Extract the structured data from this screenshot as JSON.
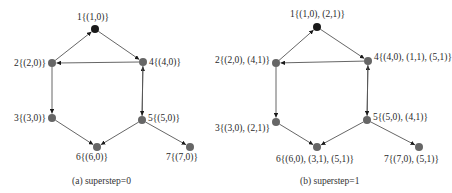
{
  "figure": {
    "panels": [
      {
        "id": "a",
        "caption": "(a)  superstep=0",
        "caption_pos": [
          72,
          184
        ],
        "nodes": [
          {
            "id": "1",
            "label": "1{(1,0)}",
            "x": 95,
            "y": 29,
            "color": "#1a1a1a",
            "lx": 77,
            "ly": 20,
            "anchor": "start"
          },
          {
            "id": "2",
            "label": "2{(2,0)}",
            "x": 52,
            "y": 63,
            "color": "#666666",
            "lx": 46,
            "ly": 66,
            "anchor": "end"
          },
          {
            "id": "3",
            "label": "3{(3,0)}",
            "x": 52,
            "y": 118,
            "color": "#666666",
            "lx": 46,
            "ly": 121,
            "anchor": "end"
          },
          {
            "id": "4",
            "label": "4{(4,0)}",
            "x": 143,
            "y": 62,
            "color": "#666666",
            "lx": 149,
            "ly": 65,
            "anchor": "start"
          },
          {
            "id": "5",
            "label": "5{(5,0)}",
            "x": 142,
            "y": 120,
            "color": "#666666",
            "lx": 148,
            "ly": 121,
            "anchor": "start"
          },
          {
            "id": "6",
            "label": "6{(6,0)}",
            "x": 97,
            "y": 147,
            "color": "#666666",
            "lx": 76,
            "ly": 160,
            "anchor": "start"
          },
          {
            "id": "7",
            "label": "7{(7,0)}",
            "x": 190,
            "y": 147,
            "color": "#666666",
            "lx": 166,
            "ly": 160,
            "anchor": "start"
          }
        ]
      },
      {
        "id": "b",
        "caption": "(b)  superstep=1",
        "caption_pos": [
          300,
          184
        ],
        "nodes": [
          {
            "id": "1",
            "label": "1{(1,0), (2,1)}",
            "x": 317,
            "y": 27,
            "color": "#1a1a1a",
            "lx": 290,
            "ly": 17,
            "anchor": "start"
          },
          {
            "id": "2",
            "label": "2{(2,0), (4,1)}",
            "x": 276,
            "y": 63,
            "color": "#666666",
            "lx": 270,
            "ly": 63,
            "anchor": "end"
          },
          {
            "id": "3",
            "label": "3{(3,0), (2,1)}",
            "x": 276,
            "y": 122,
            "color": "#666666",
            "lx": 270,
            "ly": 131,
            "anchor": "end"
          },
          {
            "id": "4",
            "label": "4{(4,0), (1,1), (5,1)}",
            "x": 368,
            "y": 61,
            "color": "#666666",
            "lx": 374,
            "ly": 60,
            "anchor": "start"
          },
          {
            "id": "5",
            "label": "5{(5,0), (4,1)}",
            "x": 367,
            "y": 120,
            "color": "#666666",
            "lx": 373,
            "ly": 120,
            "anchor": "start"
          },
          {
            "id": "6",
            "label": "6{(6,0), (3,1), (5,1)}",
            "x": 317,
            "y": 147,
            "color": "#666666",
            "lx": 276,
            "ly": 162,
            "anchor": "start"
          },
          {
            "id": "7",
            "label": "7{(7,0), (5,1)}",
            "x": 419,
            "y": 147,
            "color": "#666666",
            "lx": 384,
            "ly": 162,
            "anchor": "start"
          }
        ]
      }
    ],
    "edges": [
      {
        "from": "2",
        "to": "1"
      },
      {
        "from": "1",
        "to": "4"
      },
      {
        "from": "4",
        "to": "2"
      },
      {
        "from": "2",
        "to": "3"
      },
      {
        "from": "3",
        "to": "6"
      },
      {
        "from": "5",
        "to": "6"
      },
      {
        "from": "5",
        "to": "4"
      },
      {
        "from": "4",
        "to": "5"
      },
      {
        "from": "5",
        "to": "7"
      }
    ],
    "colors": {
      "edge": "#555555",
      "node": "#666666",
      "source_node": "#1a1a1a",
      "text": "#2a2a2a"
    }
  }
}
